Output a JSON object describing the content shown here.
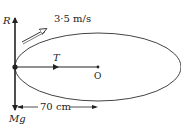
{
  "diagram": {
    "type": "physics-free-body",
    "labels": {
      "reaction": "R",
      "velocity": "3·5 m/s",
      "tension": "T",
      "center": "O",
      "weight": "Mg",
      "radius": "70 cm"
    },
    "colors": {
      "stroke": "#222222",
      "ellipse": "#444444",
      "background": "#ffffff"
    },
    "geometry": {
      "point": [
        15,
        67
      ],
      "center": [
        98,
        67
      ],
      "ellipse_rx": 83,
      "ellipse_ry": 34
    }
  }
}
